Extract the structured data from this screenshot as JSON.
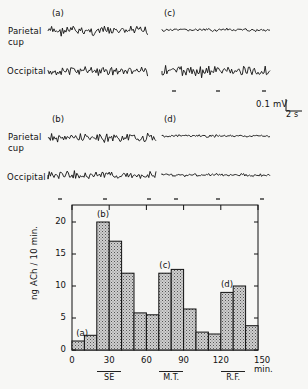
{
  "eeg": {
    "panels": [
      {
        "id": "a",
        "label": "(a)",
        "pattern": "dense"
      },
      {
        "id": "c",
        "label": "(c)",
        "pattern": "mixed"
      },
      {
        "id": "b",
        "label": "(b)",
        "pattern": "dense"
      },
      {
        "id": "d",
        "label": "(d)",
        "pattern": "flat"
      }
    ],
    "row_labels": {
      "parietal_line1": "Parietal",
      "parietal_line2": "cup",
      "occipital": "Occipital"
    },
    "scale_bar": {
      "voltage": "0.1 mV",
      "time": "2 s"
    }
  },
  "chart_data": {
    "type": "bar",
    "title": "",
    "xlabel": "min.",
    "ylabel": "ng ACh / 10 min.",
    "x_ticks": [
      "0",
      "30",
      "60",
      "90",
      "120",
      "150 min."
    ],
    "y_ticks": [
      "0",
      "5",
      "10",
      "15",
      "20"
    ],
    "xlim": [
      0,
      150
    ],
    "ylim": [
      0,
      22.5
    ],
    "bin_width_min": 10,
    "categories": [
      "0-10",
      "10-20",
      "20-30",
      "30-40",
      "40-50",
      "50-60",
      "60-70",
      "70-80",
      "80-90",
      "90-100",
      "100-110",
      "110-120",
      "120-130",
      "130-140",
      "140-150"
    ],
    "values": [
      1.4,
      2.3,
      20.0,
      17.0,
      12.0,
      5.8,
      5.5,
      12.0,
      12.6,
      6.4,
      2.8,
      2.5,
      9.0,
      10.0,
      3.8
    ],
    "annotations": [
      {
        "label": "(a)",
        "bin": 0
      },
      {
        "label": "(b)",
        "bin": 2
      },
      {
        "label": "(c)",
        "bin": 7
      },
      {
        "label": "(d)",
        "bin": 12
      }
    ],
    "conditions": [
      {
        "label": "SE",
        "start": 20,
        "end": 40
      },
      {
        "label": "M.T.",
        "start": 70,
        "end": 90
      },
      {
        "label": "R.F.",
        "start": 120,
        "end": 140
      }
    ],
    "grid": false,
    "fill": "hatched grey"
  }
}
